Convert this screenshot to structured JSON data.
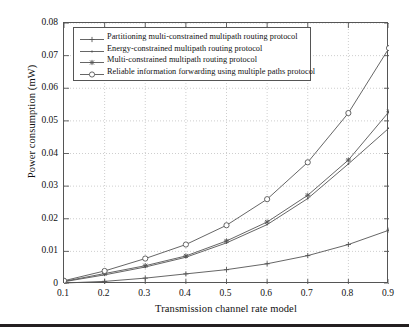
{
  "chart_data": {
    "type": "line",
    "title": "",
    "xlabel": "Transmission channel rate model",
    "ylabel": "Power consumption (mW)",
    "x": [
      0.1,
      0.2,
      0.3,
      0.4,
      0.5,
      0.6,
      0.7,
      0.8,
      0.9
    ],
    "xlim": [
      0.1,
      0.9
    ],
    "ylim": [
      0,
      0.08
    ],
    "xticks": [
      "0.1",
      "0.2",
      "0.3",
      "0.4",
      "0.5",
      "0.6",
      "0.7",
      "0.8",
      "0.9"
    ],
    "yticks": [
      "0",
      "0.01",
      "0.02",
      "0.03",
      "0.04",
      "0.05",
      "0.06",
      "0.07",
      "0.08"
    ],
    "ytick_values": [
      0,
      0.01,
      0.02,
      0.03,
      0.04,
      0.05,
      0.06,
      0.07,
      0.08
    ],
    "grid": true,
    "grid_style": "dotted",
    "legend_position": "top-left-inside",
    "line_color": "#555555",
    "series": [
      {
        "name": "Partitioning multi-constrained multipath routing protocol",
        "marker": "plus",
        "values": [
          0.0003,
          0.0008,
          0.0018,
          0.0031,
          0.0044,
          0.0062,
          0.0087,
          0.0121,
          0.0165
        ]
      },
      {
        "name": "Energy-constrained multipath routing protocol",
        "marker": "dot",
        "values": [
          0.0007,
          0.0028,
          0.0052,
          0.0082,
          0.0126,
          0.0182,
          0.0262,
          0.0368,
          0.0478
        ]
      },
      {
        "name": "Multi-constrained multipath routing protocol",
        "marker": "asterisk",
        "values": [
          0.0008,
          0.0032,
          0.0056,
          0.0086,
          0.0132,
          0.019,
          0.0272,
          0.038,
          0.0528
        ]
      },
      {
        "name": "Reliable information forwarding using multiple paths protocol",
        "marker": "circle",
        "values": [
          0.001,
          0.004,
          0.0078,
          0.0121,
          0.018,
          0.026,
          0.0373,
          0.0524,
          0.0723
        ]
      }
    ]
  }
}
